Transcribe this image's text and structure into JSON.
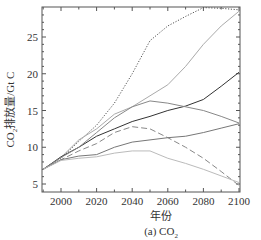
{
  "chart_data": {
    "type": "line",
    "title": "",
    "caption": "(a) CO2",
    "xlabel": "年份",
    "ylabel": "CO2排放量/Gt C",
    "xlim": [
      1990,
      2100
    ],
    "ylim": [
      4.5,
      29
    ],
    "xticks": [
      2000,
      2020,
      2040,
      2060,
      2080,
      2100
    ],
    "yticks": [
      5,
      10,
      15,
      20,
      25
    ],
    "grid": false,
    "legend": "none",
    "x": [
      1990,
      2000,
      2010,
      2020,
      2030,
      2040,
      2050,
      2060,
      2070,
      2080,
      2090,
      2100
    ],
    "series": [
      {
        "name": "dotted-high",
        "style": "dotted",
        "color": "#555555",
        "values": [
          7,
          8.5,
          10.8,
          13,
          16,
          20,
          24.5,
          26.5,
          27.8,
          29,
          28.9,
          28.7
        ]
      },
      {
        "name": "light-solid-high",
        "style": "solid",
        "color": "#aaaaaa",
        "values": [
          7,
          8.6,
          11,
          12.5,
          14.5,
          15.5,
          17,
          18.5,
          21,
          24,
          26.5,
          28.5
        ]
      },
      {
        "name": "dark-solid",
        "style": "solid",
        "color": "#333333",
        "values": [
          7,
          8.7,
          10,
          11.5,
          12.5,
          13.5,
          14.2,
          15,
          15.6,
          16.5,
          18.3,
          20.2
        ]
      },
      {
        "name": "medium-peak",
        "style": "solid",
        "color": "#888888",
        "values": [
          7,
          8.6,
          10,
          12,
          14,
          15.5,
          16.3,
          16,
          15.5,
          15,
          14.2,
          13.3
        ]
      },
      {
        "name": "dashed",
        "style": "dashed",
        "color": "#888888",
        "values": [
          7,
          8.3,
          9.5,
          10.5,
          12,
          12.8,
          12.5,
          11.3,
          10,
          8.5,
          6.7,
          4.8
        ]
      },
      {
        "name": "gray-rising",
        "style": "solid",
        "color": "#777777",
        "values": [
          7,
          8.3,
          8.8,
          9.0,
          10,
          10.7,
          11,
          11.3,
          11.5,
          12,
          12.6,
          13.2
        ]
      },
      {
        "name": "light-low",
        "style": "solid",
        "color": "#bbbbbb",
        "values": [
          7,
          8.2,
          8.5,
          8.7,
          9.2,
          9.5,
          9.5,
          8.5,
          7.8,
          7,
          6.1,
          5.2
        ]
      }
    ]
  },
  "labels": {
    "xlabel": "年份",
    "ylabel_prefix": "CO",
    "ylabel_sub": "2",
    "ylabel_suffix": "排放量/Gt C",
    "caption_prefix": "(a) CO",
    "caption_sub": "2"
  }
}
